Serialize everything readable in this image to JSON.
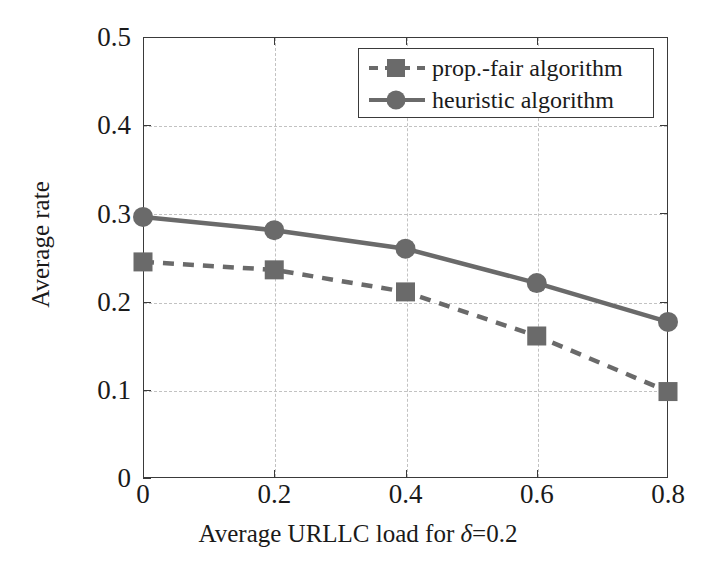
{
  "chart_data": {
    "type": "line",
    "title": "",
    "xlabel": "Average URLLC load for δ=0.2",
    "ylabel": "Average rate",
    "x": [
      0,
      0.2,
      0.4,
      0.6,
      0.8
    ],
    "xlim": [
      0,
      0.8
    ],
    "ylim": [
      0,
      0.5
    ],
    "xticks": [
      "0",
      "0.2",
      "0.4",
      "0.6",
      "0.8"
    ],
    "yticks": [
      "0",
      "0.1",
      "0.2",
      "0.3",
      "0.4",
      "0.5"
    ],
    "xtick_values": [
      0,
      0.2,
      0.4,
      0.6,
      0.8
    ],
    "ytick_values": [
      0,
      0.1,
      0.2,
      0.3,
      0.4,
      0.5
    ],
    "grid": true,
    "grid_style": "dashed",
    "legend_position": "top-right",
    "series": [
      {
        "name": "prop.-fair algorithm",
        "values": [
          0.245,
          0.236,
          0.211,
          0.161,
          0.098
        ],
        "line_style": "dashed",
        "marker": "square",
        "color": "#6a6a6a"
      },
      {
        "name": "heuristic algorithm",
        "values": [
          0.296,
          0.281,
          0.26,
          0.221,
          0.177
        ],
        "line_style": "solid",
        "marker": "circle",
        "color": "#6a6a6a"
      }
    ]
  },
  "axis": {
    "xlabel_prefix": "Average URLLC load for ",
    "xlabel_delta": "δ",
    "xlabel_suffix": "=0.2",
    "ylabel": "Average rate"
  },
  "legend": {
    "items": [
      {
        "label": "prop.-fair algorithm"
      },
      {
        "label": "heuristic algorithm"
      }
    ]
  },
  "colors": {
    "series": "#6a6a6a",
    "axis": "#3a3a3a",
    "grid": "#c2c2c2",
    "text": "#1a1a1a",
    "background": "#ffffff"
  }
}
